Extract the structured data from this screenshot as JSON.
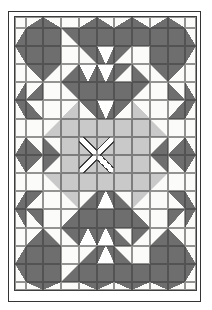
{
  "diagram": {
    "title": "Quilt pattern diagram (bear's paw variation with sawtooth border and light center medallion)",
    "colors": {
      "background": "#ffffff",
      "paper": "#fbfbf9",
      "dark": "#6e6e6e",
      "light": "#c9c9c9",
      "line": "#3e3e3e",
      "frame": "#343434"
    },
    "frame": {
      "x": 8,
      "y": 11,
      "width": 193,
      "height": 291
    },
    "grid": {
      "x": 14,
      "y": 16,
      "width": 183,
      "height": 275,
      "columns": 11,
      "rows": 16,
      "col_template": "10.7px repeat(9, 1fr) 10.7px",
      "row_template": "10.7px repeat(14, 1fr) 8px",
      "legend": {
        "W": "white square",
        "D": "dark solid square",
        "L": "light gray solid square",
        "d1": "dark triangle filling top-left",
        "d2": "dark triangle filling top-right",
        "d3": "dark triangle filling bottom-left",
        "d4": "dark triangle filling bottom-right",
        "l1": "light triangle filling top-left",
        "l2": "light triangle filling top-right",
        "l3": "light triangle filling bottom-left",
        "l4": "light triangle filling bottom-right",
        "GD": "white triangle pointing down on dark (flying goose)",
        "GU": "white triangle pointing up on dark (flying goose)",
        "X1": "light square with white diagonal band top-left to bottom-right",
        "X2": "light square with white diagonal band top-right to bottom-left"
      },
      "cells": [
        "W d4 d3 W d4 d3 d4 d3 d4 d3 W",
        "d4 D D d2 D D D D D D d3",
        "d2 D D W d2 GD d1 W D D d1",
        "W d2 d1 d4 GD GD d1 d3 d2 d1 W",
        "d4 d4 W d2 D D D d1 W d3 d3",
        "d2 d3 W l4 d2 GD d1 l3 W d4 d1",
        "W W l4 L L L L L l3 W W",
        "d4 d3 d3 L X1 X2 L L d4 d4 d3",
        "d2 d1 d1 L X2 X1 L L d2 d2 d1",
        "W W l2 L L L L L l1 W W",
        "d4 d1 W l2 d4 GU d3 l1 W d2 d3",
        "d2 d2 W d4 D D D d3 W d1 d1",
        "W d4 d3 d2 GU GU d3 d1 d4 d3 W",
        "d4 D D W d4 GU d3 W D D d3",
        "d2 D D d4 D D D D D D d1",
        "W d2 d1 W d2 d1 d2 d1 d2 d1 W"
      ]
    }
  }
}
